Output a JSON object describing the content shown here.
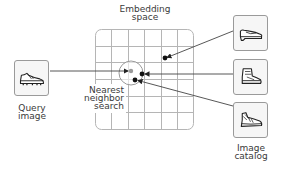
{
  "diagram": {
    "title": "Embedding space nearest neighbor search",
    "labels": {
      "embedding_space": [
        "Embedding",
        "space"
      ],
      "query_image": [
        "Query",
        "image"
      ],
      "nearest_neighbor": [
        "Nearest",
        "neighbor",
        "search"
      ],
      "image_catalog": [
        "Image",
        "catalog"
      ]
    },
    "query": {
      "icon": "cleat-shoe-icon"
    },
    "catalog": [
      {
        "icon": "loafer-shoe-icon"
      },
      {
        "icon": "high-top-sneaker-icon"
      },
      {
        "icon": "running-sneaker-icon"
      }
    ],
    "embedding_points": [
      {
        "name": "query-point",
        "x": 131,
        "y": 71,
        "color": "#999999"
      },
      {
        "name": "catalog-point-1",
        "x": 165,
        "y": 58,
        "color": "#111111"
      },
      {
        "name": "catalog-point-2",
        "x": 142,
        "y": 74,
        "color": "#111111"
      },
      {
        "name": "catalog-point-3",
        "x": 135,
        "y": 80,
        "color": "#111111"
      }
    ],
    "colors": {
      "line": "#444444",
      "grid": "#b5b5b5",
      "box_border": "#9a9a9a",
      "box_fill": "#f6f6f6",
      "point": "#111111",
      "query_point": "#999999"
    }
  }
}
